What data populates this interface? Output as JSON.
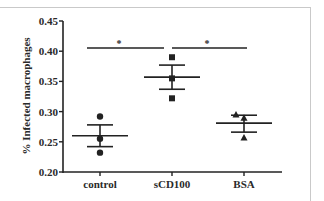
{
  "chart_data": {
    "type": "scatter",
    "title": "",
    "xlabel": "",
    "ylabel": "% Infected macrophages",
    "ylim": [
      0.2,
      0.45
    ],
    "yticks": [
      "0.20",
      "0.25",
      "0.30",
      "0.35",
      "0.40",
      "0.45"
    ],
    "grid": false,
    "legend": null,
    "categories": [
      "control",
      "sCD100",
      "BSA"
    ],
    "series": [
      {
        "name": "control",
        "marker": "circle",
        "values": [
          0.292,
          0.255,
          0.232
        ],
        "mean": 0.26,
        "sem_upper": 0.278,
        "sem_lower": 0.242
      },
      {
        "name": "sCD100",
        "marker": "square",
        "values": [
          0.39,
          0.355,
          0.322
        ],
        "mean": 0.357,
        "sem_upper": 0.377,
        "sem_lower": 0.337
      },
      {
        "name": "BSA",
        "marker": "triangle",
        "values": [
          0.295,
          0.29,
          0.257
        ],
        "mean": 0.281,
        "sem_upper": 0.294,
        "sem_lower": 0.266
      }
    ],
    "annotations": [
      {
        "type": "significance",
        "from": "control",
        "to": "sCD100",
        "label": "*"
      },
      {
        "type": "significance",
        "from": "sCD100",
        "to": "BSA",
        "label": "*"
      }
    ]
  }
}
